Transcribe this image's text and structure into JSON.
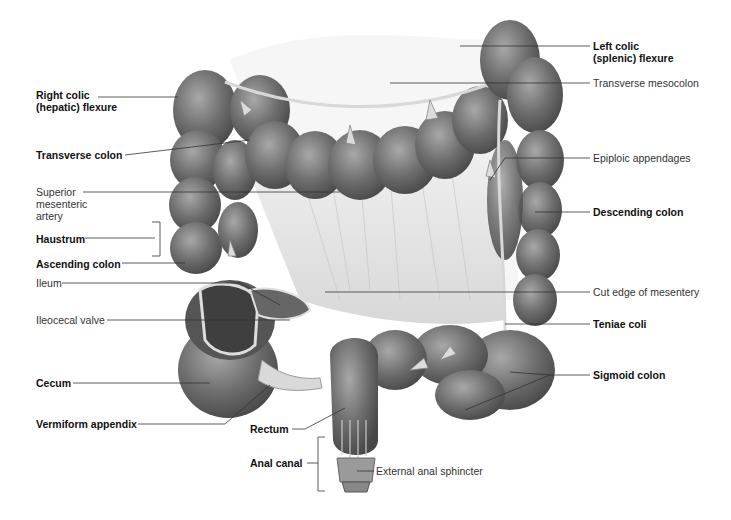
{
  "figure": {
    "type": "anatomical-illustration",
    "palette": {
      "background": "#ffffff",
      "colon_fill": "#6e6e6e",
      "colon_dark": "#474747",
      "colon_light": "#9a9a9a",
      "mesentery": "#e4e4e4",
      "leader_line": "#333333",
      "text": "#111111"
    }
  },
  "labels": {
    "left": [
      {
        "id": "right-colic-flexure",
        "text": "Right colic\n(hepatic) flexure",
        "bold": true
      },
      {
        "id": "transverse-colon",
        "text": "Transverse colon",
        "bold": true
      },
      {
        "id": "superior-mesenteric-artery",
        "text": "Superior\nmesenteric\nartery",
        "bold": false
      },
      {
        "id": "haustrum",
        "text": "Haustrum",
        "bold": true
      },
      {
        "id": "ascending-colon",
        "text": "Ascending colon",
        "bold": true
      },
      {
        "id": "ileum",
        "text": "Ileum",
        "bold": false
      },
      {
        "id": "ileocecal-valve",
        "text": "Ileocecal valve",
        "bold": false
      },
      {
        "id": "cecum",
        "text": "Cecum",
        "bold": true
      },
      {
        "id": "vermiform-appendix",
        "text": "Vermiform appendix",
        "bold": true
      }
    ],
    "right": [
      {
        "id": "left-colic-flexure",
        "text": "Left colic\n(splenic) flexure",
        "bold": true
      },
      {
        "id": "transverse-mesocolon",
        "text": "Transverse mesocolon",
        "bold": false
      },
      {
        "id": "epiploic-appendages",
        "text": "Epiploic appendages",
        "bold": false
      },
      {
        "id": "descending-colon",
        "text": "Descending colon",
        "bold": true
      },
      {
        "id": "cut-edge-of-mesentery",
        "text": "Cut edge of mesentery",
        "bold": false
      },
      {
        "id": "teniae-coli",
        "text": "Teniae coli",
        "bold": true
      },
      {
        "id": "sigmoid-colon",
        "text": "Sigmoid colon",
        "bold": true
      }
    ],
    "bottom": [
      {
        "id": "rectum",
        "text": "Rectum",
        "bold": true
      },
      {
        "id": "anal-canal",
        "text": "Anal canal",
        "bold": true
      },
      {
        "id": "external-anal-sphincter",
        "text": "External anal sphincter",
        "bold": false
      }
    ]
  }
}
